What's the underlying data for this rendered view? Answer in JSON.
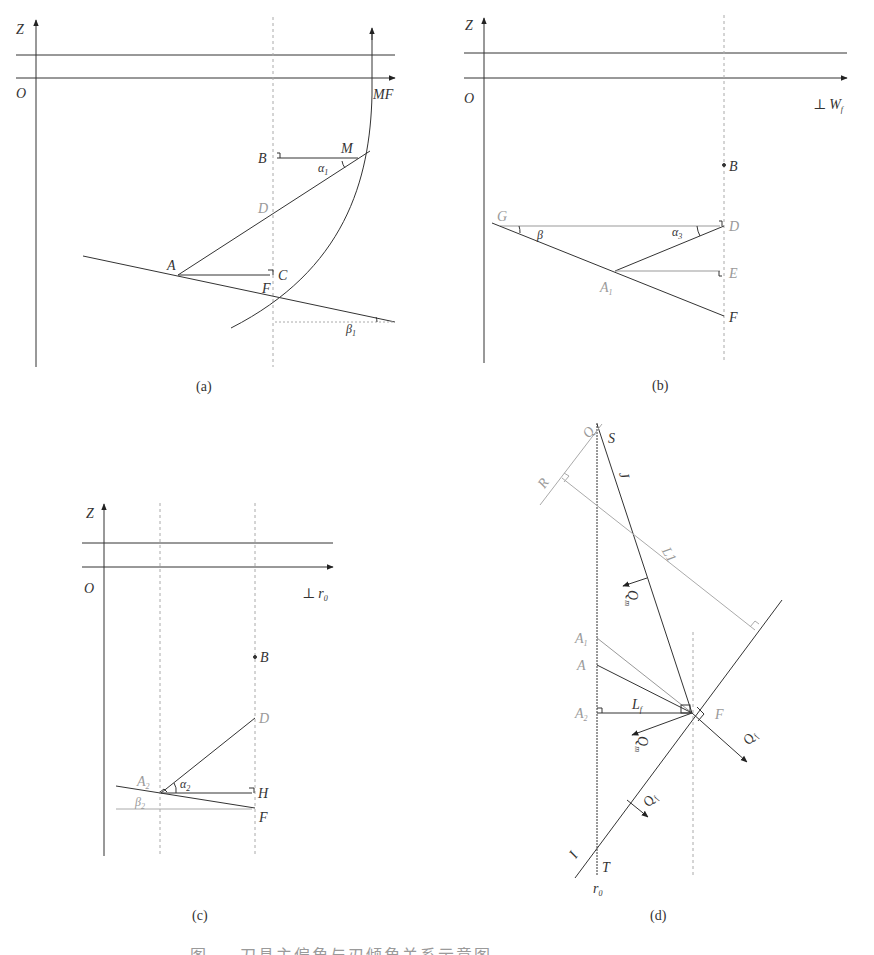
{
  "figure": {
    "panels": [
      {
        "id": "a",
        "sublabel": "(a)",
        "axis_labels": {
          "z": "Z",
          "origin": "O",
          "x": "MF"
        },
        "points": {
          "M": "M",
          "B": "B",
          "D": "D",
          "A": "A",
          "C": "C",
          "F": "F"
        },
        "angles": {
          "alpha": "α",
          "alpha_sub": "1",
          "beta": "β",
          "beta_sub": "1"
        }
      },
      {
        "id": "b",
        "sublabel": "(b)",
        "axis_labels": {
          "z": "Z",
          "origin": "O",
          "x_prefix": "⊥",
          "x": "W",
          "x_sub": "f"
        },
        "points": {
          "B": "B",
          "G": "G",
          "D": "D",
          "E": "E",
          "A": "A",
          "A_sub": "1",
          "F": "F"
        },
        "angles": {
          "beta": "β",
          "alpha": "α",
          "alpha_sub": "3"
        }
      },
      {
        "id": "c",
        "sublabel": "(c)",
        "axis_labels": {
          "z": "Z",
          "origin": "O",
          "x_prefix": "⊥",
          "x": "r",
          "x_sub": "0"
        },
        "points": {
          "B": "B",
          "D": "D",
          "A": "A",
          "A_sub": "2",
          "H": "H",
          "F": "F"
        },
        "angles": {
          "alpha": "α",
          "alpha_sub": "2",
          "beta": "β",
          "beta_sub": "2"
        }
      },
      {
        "id": "d",
        "sublabel": "(d)",
        "points": {
          "Q": "Q",
          "S": "S",
          "R": "R",
          "J": "J",
          "L1": "L1",
          "A1": "A",
          "A1_sub": "1",
          "A": "A",
          "A2": "A",
          "A2_sub": "2",
          "F": "F",
          "I": "I",
          "T": "T"
        },
        "vectors": {
          "Qm": "Q",
          "Qm_sub": "m",
          "Qf": "Q",
          "Qf_sub": "f"
        },
        "segment_labels": {
          "Lf": "L",
          "Lf_sub": "f"
        },
        "axis_labels": {
          "r": "r",
          "r_sub": "0"
        }
      }
    ],
    "caption_partial": "图 — 刀具主偏角与刃倾角关系示意图"
  }
}
